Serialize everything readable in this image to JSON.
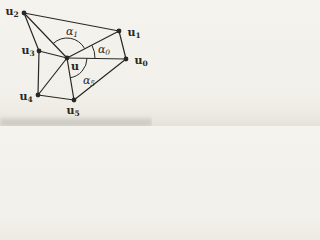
{
  "figure": {
    "background_color": "#f3f1ec",
    "ink_color": "#2a2825",
    "line_width": 1.2,
    "dot_radius": 2.4,
    "center_id": "u",
    "vertices": [
      {
        "id": "u",
        "base": "u",
        "sub": "",
        "x": 67,
        "y": 58,
        "label_x": 75,
        "label_y": 66
      },
      {
        "id": "u0",
        "base": "u",
        "sub": "0",
        "x": 126,
        "y": 59,
        "label_x": 141,
        "label_y": 60
      },
      {
        "id": "u1",
        "base": "u",
        "sub": "1",
        "x": 119,
        "y": 31,
        "label_x": 134,
        "label_y": 32
      },
      {
        "id": "u2",
        "base": "u",
        "sub": "2",
        "x": 24,
        "y": 13,
        "label_x": 12,
        "label_y": 11
      },
      {
        "id": "u3",
        "base": "u",
        "sub": "3",
        "x": 39,
        "y": 51,
        "label_x": 28,
        "label_y": 50
      },
      {
        "id": "u4",
        "base": "u",
        "sub": "4",
        "x": 38,
        "y": 95,
        "label_x": 26,
        "label_y": 96
      },
      {
        "id": "u5",
        "base": "u",
        "sub": "5",
        "x": 74,
        "y": 100,
        "label_x": 73,
        "label_y": 110
      }
    ],
    "edges": [
      {
        "from": "u",
        "to": "u0"
      },
      {
        "from": "u",
        "to": "u1"
      },
      {
        "from": "u",
        "to": "u2"
      },
      {
        "from": "u",
        "to": "u3"
      },
      {
        "from": "u",
        "to": "u4"
      },
      {
        "from": "u",
        "to": "u5"
      },
      {
        "from": "u0",
        "to": "u1"
      },
      {
        "from": "u1",
        "to": "u2"
      },
      {
        "from": "u2",
        "to": "u3"
      },
      {
        "from": "u3",
        "to": "u4"
      },
      {
        "from": "u4",
        "to": "u5"
      },
      {
        "from": "u5",
        "to": "u0"
      }
    ],
    "angles": [
      {
        "id": "alpha0",
        "base": "α",
        "sub": "0",
        "from": "u0",
        "to": "u1",
        "radius": 28,
        "label_x": 104,
        "label_y": 49
      },
      {
        "id": "alpha1",
        "base": "α",
        "sub": "1",
        "from": "u1",
        "to": "u2",
        "radius": 20,
        "label_x": 72,
        "label_y": 31
      },
      {
        "id": "alpha5",
        "base": "α",
        "sub": "5",
        "from": "u5",
        "to": "u0",
        "radius": 20,
        "label_x": 89,
        "label_y": 80
      }
    ]
  }
}
